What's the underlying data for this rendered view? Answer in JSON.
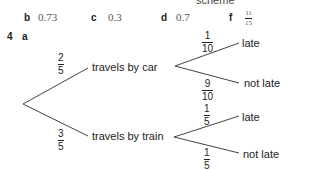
{
  "header_cut": "scheme",
  "answers_row": [
    {
      "label": "b",
      "value": "0.73"
    },
    {
      "label": "c",
      "value": "0.3"
    },
    {
      "label": "d",
      "value": "0.7"
    },
    {
      "label": "f",
      "num": "11",
      "den": "15"
    }
  ],
  "question": {
    "number": "4",
    "part": "a"
  },
  "tree": {
    "first": [
      {
        "label": "travels by car",
        "num": "2",
        "den": "5"
      },
      {
        "label": "travels by train",
        "num": "3",
        "den": "5"
      }
    ],
    "car": [
      {
        "label": "late",
        "num": "1",
        "den": "10"
      },
      {
        "label": "not late",
        "num": "9",
        "den": "10"
      }
    ],
    "train": [
      {
        "label": "late",
        "num": "1",
        "den": "5"
      },
      {
        "label": "not late",
        "num": "1",
        "den": "5"
      }
    ]
  }
}
